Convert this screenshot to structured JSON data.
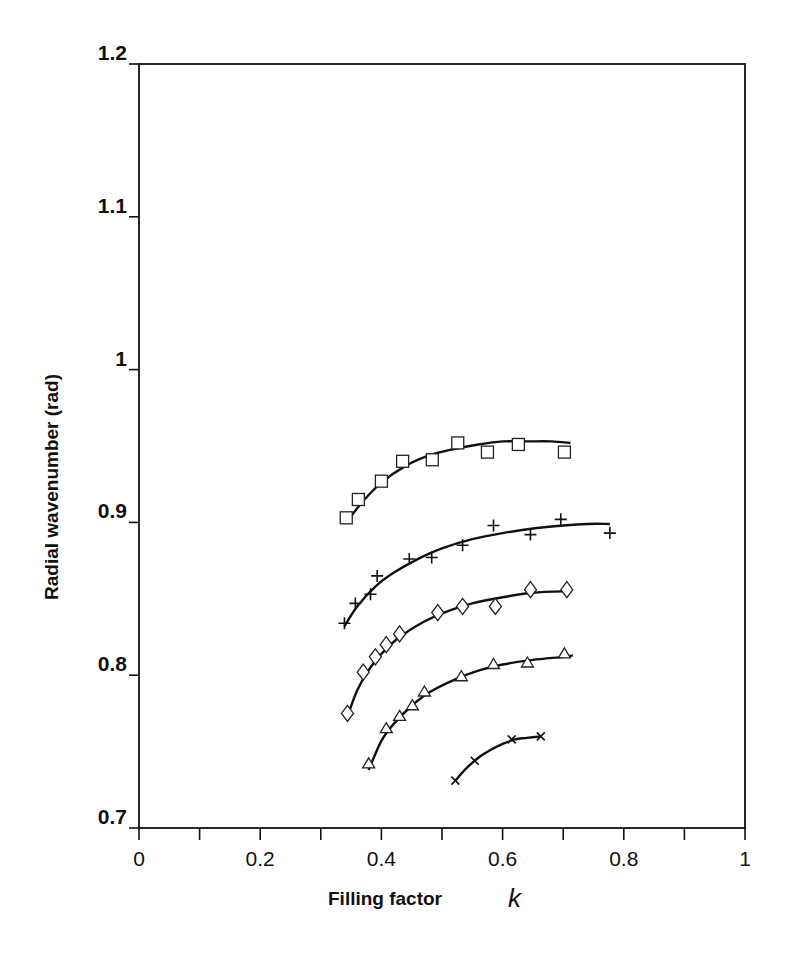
{
  "chart_data": {
    "type": "scatter",
    "title": "",
    "xlabel": "Filling factor",
    "xlabel_var": "k",
    "ylabel": "Radial wavenumber (rad)",
    "xlim": [
      0,
      1
    ],
    "ylim": [
      0.7,
      1.2
    ],
    "x_ticks": [
      0,
      0.1,
      0.2,
      0.3,
      0.4,
      0.5,
      0.6,
      0.7,
      0.8,
      0.9,
      1
    ],
    "x_tick_labels": [
      "0",
      "",
      "0.2",
      "",
      "0.4",
      "",
      "0.6",
      "",
      "0.8",
      "",
      "1"
    ],
    "y_ticks": [
      0.7,
      0.8,
      0.9,
      1.0,
      1.1,
      1.2
    ],
    "y_tick_labels": [
      "0.7",
      "0.8",
      "0.9",
      "1",
      "1.1",
      "1.2"
    ],
    "grid": false,
    "legend": "none",
    "series": [
      {
        "name": "squares",
        "marker": "square",
        "x": [
          0.342,
          0.362,
          0.4,
          0.435,
          0.484,
          0.526,
          0.575,
          0.626,
          0.702
        ],
        "y": [
          0.903,
          0.915,
          0.927,
          0.94,
          0.941,
          0.952,
          0.946,
          0.951,
          0.946
        ],
        "fit_x": [
          0.342,
          0.37,
          0.4,
          0.44,
          0.48,
          0.52,
          0.56,
          0.6,
          0.64,
          0.68,
          0.712
        ],
        "fit_y": [
          0.9,
          0.914,
          0.926,
          0.937,
          0.944,
          0.948,
          0.951,
          0.953,
          0.953,
          0.953,
          0.952
        ]
      },
      {
        "name": "plus",
        "marker": "plus",
        "x": [
          0.339,
          0.357,
          0.382,
          0.393,
          0.446,
          0.483,
          0.534,
          0.585,
          0.646,
          0.696,
          0.777
        ],
        "y": [
          0.834,
          0.847,
          0.853,
          0.865,
          0.876,
          0.877,
          0.885,
          0.898,
          0.892,
          0.902,
          0.893
        ],
        "fit_x": [
          0.339,
          0.36,
          0.39,
          0.42,
          0.46,
          0.5,
          0.55,
          0.6,
          0.65,
          0.7,
          0.74,
          0.777
        ],
        "fit_y": [
          0.832,
          0.845,
          0.858,
          0.867,
          0.876,
          0.883,
          0.889,
          0.893,
          0.896,
          0.898,
          0.899,
          0.899
        ]
      },
      {
        "name": "diamonds",
        "marker": "diamond",
        "x": [
          0.344,
          0.37,
          0.39,
          0.408,
          0.43,
          0.493,
          0.534,
          0.588,
          0.646,
          0.706
        ],
        "y": [
          0.775,
          0.802,
          0.812,
          0.82,
          0.827,
          0.841,
          0.845,
          0.845,
          0.856,
          0.856
        ],
        "fit_x": [
          0.344,
          0.36,
          0.38,
          0.4,
          0.43,
          0.47,
          0.51,
          0.55,
          0.6,
          0.65,
          0.712
        ],
        "fit_y": [
          0.773,
          0.79,
          0.804,
          0.814,
          0.825,
          0.835,
          0.842,
          0.847,
          0.851,
          0.854,
          0.855
        ]
      },
      {
        "name": "triangles",
        "marker": "triangle",
        "x": [
          0.379,
          0.408,
          0.43,
          0.451,
          0.471,
          0.532,
          0.585,
          0.641,
          0.702
        ],
        "y": [
          0.742,
          0.765,
          0.773,
          0.78,
          0.789,
          0.799,
          0.807,
          0.808,
          0.814
        ],
        "fit_x": [
          0.379,
          0.4,
          0.42,
          0.45,
          0.48,
          0.52,
          0.56,
          0.6,
          0.65,
          0.7,
          0.716
        ],
        "fit_y": [
          0.738,
          0.757,
          0.768,
          0.78,
          0.789,
          0.797,
          0.803,
          0.807,
          0.81,
          0.812,
          0.813
        ]
      },
      {
        "name": "crosses",
        "marker": "x",
        "x": [
          0.522,
          0.554,
          0.615,
          0.663
        ],
        "y": [
          0.731,
          0.744,
          0.758,
          0.76
        ],
        "fit_x": [
          0.522,
          0.54,
          0.56,
          0.58,
          0.6,
          0.62,
          0.64,
          0.663
        ],
        "fit_y": [
          0.731,
          0.739,
          0.746,
          0.751,
          0.755,
          0.758,
          0.759,
          0.76
        ]
      }
    ]
  }
}
